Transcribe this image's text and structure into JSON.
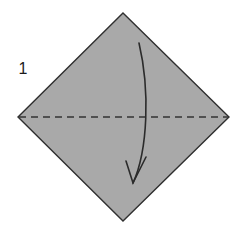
{
  "figure": {
    "kind": "origami-fold-diagram",
    "step_label": "1",
    "background_color": "#ffffff",
    "paper": {
      "name": "square-sheet-rotated-45",
      "fill_color": "#a9a9a9",
      "edge_color": "#2f2f2f",
      "edge_width": 1.4,
      "vertices": {
        "top": [
          123,
          13
        ],
        "right": [
          229,
          117
        ],
        "bottom": [
          123,
          221
        ],
        "left": [
          18,
          117
        ]
      }
    },
    "crease": {
      "name": "valley-fold-line",
      "style": "dashed",
      "color": "#333333",
      "width": 1.4,
      "dash": "7 5",
      "from": [
        19,
        117
      ],
      "to": [
        228,
        117
      ]
    },
    "arrow": {
      "name": "fold-direction-arrow",
      "color": "#2b2b2b",
      "width": 1.6,
      "start": [
        139,
        43
      ],
      "end": [
        133,
        183
      ],
      "control_1": [
        150,
        90
      ],
      "control_2": [
        148,
        150
      ],
      "head_style": "thin-barb",
      "head_tip": [
        133,
        183
      ],
      "head_left": [
        126,
        161
      ],
      "head_right": [
        146,
        157
      ]
    }
  }
}
